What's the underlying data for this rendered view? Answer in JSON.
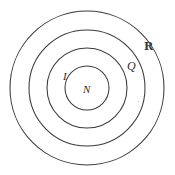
{
  "diagram": {
    "background_color": "#ffffff",
    "stroke_color": "#3a3a3a",
    "type": "nested-circles",
    "center": {
      "x": 87,
      "y": 88
    },
    "circles": [
      {
        "name": "R",
        "label": "R",
        "radius": 77,
        "cx": 87,
        "cy": 88,
        "order": 1
      },
      {
        "name": "Q",
        "label": "Q",
        "radius": 58,
        "cx": 87,
        "cy": 88,
        "order": 2
      },
      {
        "name": "I",
        "label": "I",
        "radius": 40,
        "cx": 87,
        "cy": 88,
        "order": 3
      },
      {
        "name": "N",
        "label": "N",
        "radius": 22,
        "cx": 87,
        "cy": 88,
        "order": 4
      }
    ],
    "labels": {
      "real": "R",
      "rational": "Q",
      "integer": "I",
      "natural": "N"
    }
  }
}
